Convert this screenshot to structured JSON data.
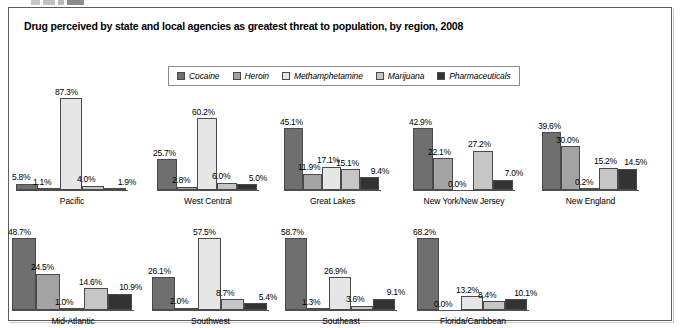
{
  "figure": {
    "title": "Drug perceived by state and local agencies as greatest threat to population, by region, 2008"
  },
  "legend": [
    {
      "label": "Cocaine",
      "color": "#6f6f6f",
      "swatch_name": "legend-swatch-cocaine"
    },
    {
      "label": "Heroin",
      "color": "#a3a3a3",
      "swatch_name": "legend-swatch-heroin"
    },
    {
      "label": "Methamphetamine",
      "color": "#e6e6e6",
      "swatch_name": "legend-swatch-methamphetamine"
    },
    {
      "label": "Marijuana",
      "color": "#c6c6c6",
      "swatch_name": "legend-swatch-marijuana"
    },
    {
      "label": "Pharmaceuticals",
      "color": "#333333",
      "swatch_name": "legend-swatch-pharmaceuticals"
    }
  ],
  "chart_data": {
    "type": "bar",
    "title": "Drug perceived by state and local agencies as greatest threat to population, by region, 2008",
    "xlabel": "",
    "ylabel": "",
    "ylim": [
      0,
      100
    ],
    "grid": false,
    "legend_position": "top-center",
    "value_suffix": "%",
    "categories": [
      "Pacific",
      "West Central",
      "Great Lakes",
      "New York/New Jersey",
      "New England",
      "Mid-Atlantic",
      "Southwest",
      "Southeast",
      "Florida/Caribbean"
    ],
    "series": [
      {
        "name": "Cocaine",
        "values": [
          5.8,
          25.7,
          45.1,
          42.9,
          39.6,
          48.7,
          26.1,
          58.7,
          68.2
        ]
      },
      {
        "name": "Heroin",
        "values": [
          1.1,
          2.8,
          11.9,
          22.1,
          30.0,
          24.5,
          2.0,
          1.3,
          0.0
        ]
      },
      {
        "name": "Methamphetamine",
        "values": [
          87.3,
          60.2,
          17.1,
          0.0,
          0.2,
          1.0,
          57.5,
          26.9,
          13.2
        ]
      },
      {
        "name": "Marijuana",
        "values": [
          4.0,
          6.0,
          15.1,
          27.2,
          15.2,
          14.6,
          8.7,
          3.6,
          8.4
        ]
      },
      {
        "name": "Pharmaceuticals",
        "values": [
          1.9,
          5.0,
          9.4,
          7.0,
          14.5,
          10.9,
          5.4,
          9.1,
          10.1
        ]
      }
    ],
    "groups": [
      {
        "label": "Pacific",
        "labels": [
          "5.8%",
          "1.1%",
          "87.3%",
          "4.0%",
          "1.9%"
        ]
      },
      {
        "label": "West Central",
        "labels": [
          "25.7%",
          "2.8%",
          "60.2%",
          "6.0%",
          "5.0%"
        ]
      },
      {
        "label": "Great Lakes",
        "labels": [
          "45.1%",
          "11.9%",
          "17.1%",
          "15.1%",
          "9.4%"
        ]
      },
      {
        "label": "New York/New Jersey",
        "labels": [
          "42.9%",
          "22.1%",
          "0.0%",
          "27.2%",
          "7.0%"
        ]
      },
      {
        "label": "New England",
        "labels": [
          "39.6%",
          "30.0%",
          "0.2%",
          "15.2%",
          "14.5%"
        ]
      },
      {
        "label": "Mid-Atlantic",
        "labels": [
          "48.7%",
          "24.5%",
          "1.0%",
          "14.6%",
          "10.9%"
        ]
      },
      {
        "label": "Southwest",
        "labels": [
          "26.1%",
          "2.0%",
          "57.5%",
          "8.7%",
          "5.4%"
        ]
      },
      {
        "label": "Southeast",
        "labels": [
          "58.7%",
          "1.3%",
          "26.9%",
          "3.6%",
          "9.1%"
        ]
      },
      {
        "label": "Florida/Caribbean",
        "labels": [
          "68.2%",
          "0.0%",
          "13.2%",
          "8.4%",
          "10.1%"
        ]
      }
    ]
  }
}
